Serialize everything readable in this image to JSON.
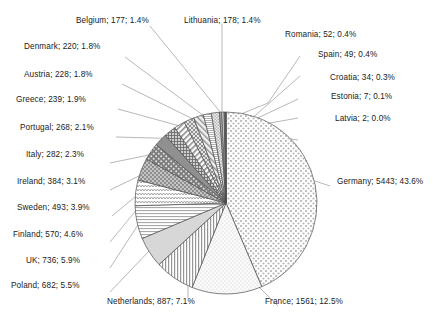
{
  "chart_data": {
    "type": "pie",
    "title": "",
    "subtitle": "",
    "xlabel": "",
    "ylabel": "",
    "legend_position": "none",
    "grid": false,
    "label_format": "name; value; percent",
    "total": 12484,
    "start_angle_deg": 0,
    "direction": "clockwise",
    "categories": [
      "Germany",
      "France",
      "Netherlands",
      "Poland",
      "UK",
      "Finland",
      "Sweden",
      "Ireland",
      "Italy",
      "Portugal",
      "Greece",
      "Austria",
      "Denmark",
      "Belgium",
      "Lithuania",
      "Romania",
      "Spain",
      "Croatia",
      "Estonia",
      "Latvia"
    ],
    "values": [
      5443,
      1561,
      887,
      682,
      736,
      570,
      493,
      384,
      282,
      268,
      239,
      228,
      220,
      177,
      178,
      52,
      49,
      34,
      7,
      2
    ],
    "percents": [
      43.6,
      12.5,
      7.1,
      5.5,
      5.9,
      4.6,
      3.9,
      3.1,
      2.3,
      2.1,
      1.9,
      1.8,
      1.8,
      1.4,
      1.4,
      0.4,
      0.4,
      0.3,
      0.1,
      0.0
    ],
    "slices": [
      {
        "name": "Germany",
        "value": 5443,
        "percent": 43.6,
        "label": "Germany; 5443; 43.6%",
        "pattern": "dots-diamond"
      },
      {
        "name": "France",
        "value": 1561,
        "percent": 12.5,
        "label": "France; 1561; 12.5%",
        "pattern": "dots-sparse"
      },
      {
        "name": "Netherlands",
        "value": 887,
        "percent": 7.1,
        "label": "Netherlands; 887; 7.1%",
        "pattern": "vertical-lines"
      },
      {
        "name": "Poland",
        "value": 682,
        "percent": 5.5,
        "label": "Poland; 682; 5.5%",
        "pattern": "solid-light"
      },
      {
        "name": "UK",
        "value": 736,
        "percent": 5.9,
        "label": "UK; 736; 5.9%",
        "pattern": "horizontal-lines"
      },
      {
        "name": "Finland",
        "value": 570,
        "percent": 4.6,
        "label": "Finland; 570; 4.6%",
        "pattern": "zigzag"
      },
      {
        "name": "Sweden",
        "value": 493,
        "percent": 3.9,
        "label": "Sweden; 493; 3.9%",
        "pattern": "checker-dark"
      },
      {
        "name": "Ireland",
        "value": 384,
        "percent": 3.1,
        "label": "Ireland; 384; 3.1%",
        "pattern": "dots-dark"
      },
      {
        "name": "Italy",
        "value": 282,
        "percent": 2.3,
        "label": "Italy; 282; 2.3%",
        "pattern": "solid-dark"
      },
      {
        "name": "Portugal",
        "value": 268,
        "percent": 2.1,
        "label": "Portugal; 268; 2.1%",
        "pattern": "grid-fine"
      },
      {
        "name": "Greece",
        "value": 239,
        "percent": 1.9,
        "label": "Greece; 239; 1.9%",
        "pattern": "diag-lines"
      },
      {
        "name": "Austria",
        "value": 228,
        "percent": 1.8,
        "label": "Austria; 228; 1.8%",
        "pattern": "crosshatch"
      },
      {
        "name": "Denmark",
        "value": 220,
        "percent": 1.8,
        "label": "Denmark; 220; 1.8%",
        "pattern": "diag-back"
      },
      {
        "name": "Belgium",
        "value": 177,
        "percent": 1.4,
        "label": "Belgium; 177; 1.4%",
        "pattern": "horizontal-fine"
      },
      {
        "name": "Lithuania",
        "value": 178,
        "percent": 1.4,
        "label": "Lithuania; 178; 1.4%",
        "pattern": "dots-mid"
      },
      {
        "name": "Romania",
        "value": 52,
        "percent": 0.4,
        "label": "Romania; 52; 0.4%",
        "pattern": "solid-gray"
      },
      {
        "name": "Spain",
        "value": 49,
        "percent": 0.4,
        "label": "Spain; 49; 0.4%",
        "pattern": "solid-light2"
      },
      {
        "name": "Croatia",
        "value": 34,
        "percent": 0.3,
        "label": "Croatia; 34; 0.3%",
        "pattern": "solid-dark2"
      },
      {
        "name": "Estonia",
        "value": 7,
        "percent": 0.1,
        "label": "Estonia; 7; 0.1%",
        "pattern": "solid-mid"
      },
      {
        "name": "Latvia",
        "value": 2,
        "percent": 0.0,
        "label": "Latvia; 2; 0.0%",
        "pattern": "solid-faint"
      }
    ]
  },
  "labels": {
    "belgium": "Belgium; 177; 1.4%",
    "lithuania": "Lithuania; 178; 1.4%",
    "romania": "Romania; 52; 0.4%",
    "spain": "Spain; 49; 0.4%",
    "croatia": "Croatia; 34; 0.3%",
    "estonia": "Estonia; 7; 0.1%",
    "latvia": "Latvia; 2; 0.0%",
    "denmark": "Denmark; 220; 1.8%",
    "austria": "Austria; 228; 1.8%",
    "greece": "Greece; 239; 1.9%",
    "portugal": "Portugal; 268; 2.1%",
    "italy": "Italy; 282; 2.3%",
    "ireland": "Ireland; 384; 3.1%",
    "sweden": "Sweden; 493; 3.9%",
    "finland": "Finland; 570; 4.6%",
    "uk": "UK; 736; 5.9%",
    "poland": "Poland; 682; 5.5%",
    "netherlands": "Netherlands; 887; 7.1%",
    "france": "France; 1561; 12.5%",
    "germany": "Germany; 5443; 43.6%"
  },
  "colors": {
    "text": "#1a1a1a",
    "leader_line": "#8a8a8a",
    "slice_border": "#4d4d4d",
    "background": "#ffffff"
  }
}
